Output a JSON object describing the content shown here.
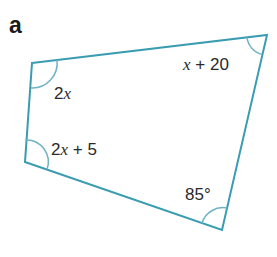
{
  "part_label": "a",
  "colors": {
    "edge": "#3a9cb0",
    "arc": "#6fb3c2",
    "text": "#2a2a2a"
  },
  "shape": {
    "type": "quadrilateral",
    "vertices": {
      "top_left": [
        32,
        63
      ],
      "top_right": [
        267,
        35
      ],
      "bottom_right": [
        222,
        230
      ],
      "bottom_left": [
        25,
        162
      ]
    }
  },
  "angles": {
    "top_left": {
      "coef": "2",
      "var": "x",
      "rest": ""
    },
    "top_right": {
      "coef": "",
      "var": "x",
      "rest": " + 20"
    },
    "bottom_left": {
      "coef": "2",
      "var": "x",
      "rest": " + 5"
    },
    "bottom_right": {
      "coef": "85°",
      "var": "",
      "rest": ""
    }
  }
}
